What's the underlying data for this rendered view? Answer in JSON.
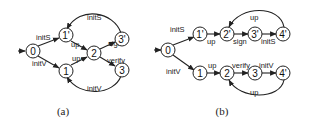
{
  "diagrams": [
    {
      "caption": "(a)",
      "nodes": [
        {
          "id": "0",
          "label": "0"
        },
        {
          "id": "1p",
          "label": "1'"
        },
        {
          "id": "1",
          "label": "1"
        },
        {
          "id": "2",
          "label": "2"
        },
        {
          "id": "3p",
          "label": "3'"
        },
        {
          "id": "3",
          "label": "3"
        }
      ],
      "edges": [
        {
          "from": "start",
          "to": "0",
          "label": ""
        },
        {
          "from": "0",
          "to": "1p",
          "label": "initS"
        },
        {
          "from": "0",
          "to": "1",
          "label": "initV"
        },
        {
          "from": "1p",
          "to": "2",
          "label": "up"
        },
        {
          "from": "1",
          "to": "2",
          "label": "up"
        },
        {
          "from": "2",
          "to": "3p",
          "label": "sign"
        },
        {
          "from": "2",
          "to": "3",
          "label": "verify"
        },
        {
          "from": "3p",
          "to": "1p",
          "label": "initS"
        },
        {
          "from": "3",
          "to": "1",
          "label": "initV"
        }
      ]
    },
    {
      "caption": "(b)",
      "nodes": [
        {
          "id": "0",
          "label": "0"
        },
        {
          "id": "1p",
          "label": "1'"
        },
        {
          "id": "2p",
          "label": "2'"
        },
        {
          "id": "3p",
          "label": "3'"
        },
        {
          "id": "4p_top",
          "label": "4'"
        },
        {
          "id": "1",
          "label": "1"
        },
        {
          "id": "2",
          "label": "2"
        },
        {
          "id": "3",
          "label": "3"
        },
        {
          "id": "4p_bottom",
          "label": "4'"
        }
      ],
      "edges": [
        {
          "from": "start",
          "to": "0",
          "label": ""
        },
        {
          "from": "0",
          "to": "1p",
          "label": "initS"
        },
        {
          "from": "0",
          "to": "1",
          "label": "initV"
        },
        {
          "from": "1p",
          "to": "2p",
          "label": "up"
        },
        {
          "from": "2p",
          "to": "3p",
          "label": "sign"
        },
        {
          "from": "3p",
          "to": "4p_top",
          "label": "initS"
        },
        {
          "from": "4p_top",
          "to": "2p",
          "label": "up"
        },
        {
          "from": "1",
          "to": "2",
          "label": "up"
        },
        {
          "from": "2",
          "to": "3",
          "label": "verify"
        },
        {
          "from": "3",
          "to": "4p_bottom",
          "label": "initV"
        },
        {
          "from": "4p_bottom",
          "to": "2",
          "label": "up"
        }
      ]
    }
  ]
}
